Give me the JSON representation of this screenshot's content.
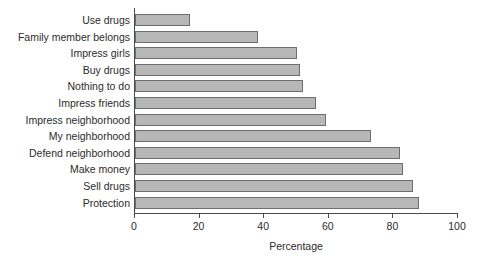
{
  "chart_data": {
    "type": "bar",
    "orientation": "horizontal",
    "title": "",
    "xlabel": "Percentage",
    "ylabel": "",
    "xlim": [
      0,
      100
    ],
    "xticks": [
      0,
      20,
      40,
      60,
      80,
      100
    ],
    "grid": false,
    "legend": null,
    "bar_color": "#b7b7b7",
    "bar_edge_color": "#6e6e6e",
    "categories": [
      "Use drugs",
      "Family member belongs",
      "Impress girls",
      "Buy drugs",
      "Nothing to do",
      "Impress friends",
      "Impress neighborhood",
      "My neighborhood",
      "Defend neighborhood",
      "Make money",
      "Sell drugs",
      "Protection"
    ],
    "values": [
      17,
      38,
      50,
      51,
      52,
      56,
      59,
      73,
      82,
      83,
      86,
      88
    ]
  }
}
